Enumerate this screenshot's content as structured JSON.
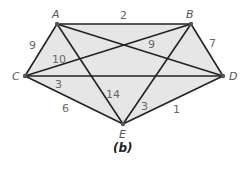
{
  "diagram": {
    "caption": "(b)",
    "fill_color": "#e6e6e6",
    "edge_color": "#222222",
    "vertices": [
      {
        "id": "A",
        "label": "A",
        "x": 57,
        "y": 24
      },
      {
        "id": "B",
        "label": "B",
        "x": 191,
        "y": 24
      },
      {
        "id": "C",
        "label": "C",
        "x": 25,
        "y": 76
      },
      {
        "id": "D",
        "label": "D",
        "x": 223,
        "y": 76
      },
      {
        "id": "E",
        "label": "E",
        "x": 123,
        "y": 124
      }
    ],
    "edges": [
      {
        "from": "A",
        "to": "B",
        "weight": "2"
      },
      {
        "from": "A",
        "to": "C",
        "weight": "9"
      },
      {
        "from": "C",
        "to": "B",
        "weight": "10"
      },
      {
        "from": "A",
        "to": "D",
        "weight": "9"
      },
      {
        "from": "B",
        "to": "D",
        "weight": "7"
      },
      {
        "from": "C",
        "to": "D",
        "weight": "3"
      },
      {
        "from": "C",
        "to": "E",
        "weight": "6"
      },
      {
        "from": "A",
        "to": "E",
        "weight": "14"
      },
      {
        "from": "B",
        "to": "E",
        "weight": "3"
      },
      {
        "from": "D",
        "to": "E",
        "weight": "1"
      }
    ]
  }
}
